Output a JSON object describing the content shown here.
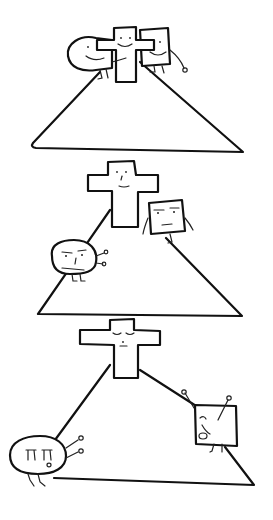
{
  "comic": {
    "title_strip": "· · · · · · · · · · ·",
    "panels": [
      {
        "index": 1,
        "description": "Smiling cross atop a triangular hill, a smiling round blob and a smiling square hug it from both sides",
        "characters": [
          "cross-smiling",
          "blob-smiling",
          "square-smiling"
        ]
      },
      {
        "index": 2,
        "description": "Cross stands on the hill top, blob and square slide down the slopes with annoyed faces",
        "characters": [
          "cross-calm",
          "blob-annoyed",
          "square-annoyed"
        ]
      },
      {
        "index": 3,
        "description": "Cross with closed eyes on the peak, blob crying at bottom left, square crying near bottom right",
        "characters": [
          "cross-eyes-closed",
          "blob-crying",
          "square-crying"
        ]
      }
    ]
  }
}
